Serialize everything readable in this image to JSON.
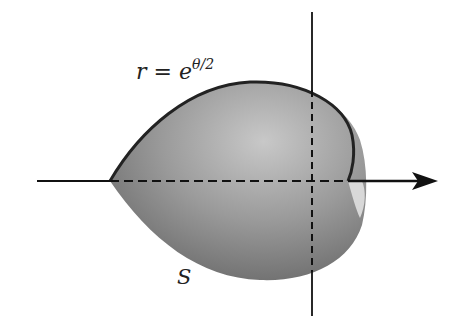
{
  "figure": {
    "curve_label": {
      "lhs": "r",
      "eq": "=",
      "base": "e",
      "exponent": "θ/2"
    },
    "surface_label": "S",
    "colors": {
      "surface_dark": "#6a6a6a",
      "surface_light": "#b8b8b8",
      "axis": "#111111",
      "outline": "#222222"
    }
  }
}
